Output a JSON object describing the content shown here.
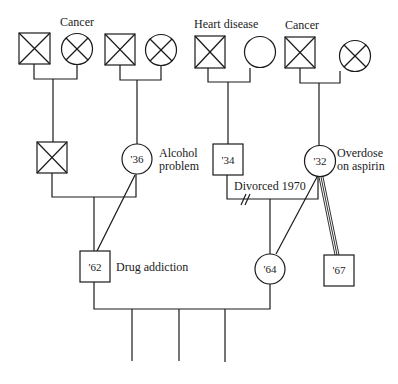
{
  "diagram": {
    "type": "genogram",
    "generation1": {
      "couple1": {
        "label": "Cancer",
        "male": "deceased",
        "female": "deceased"
      },
      "couple2": {
        "male": "deceased",
        "female": "deceased"
      },
      "couple3": {
        "label": "Heart disease",
        "male": "deceased",
        "female": "living"
      },
      "couple4": {
        "label": "Cancer",
        "male": "deceased",
        "female": "deceased"
      }
    },
    "generation2": {
      "person1": {
        "sex": "male",
        "status": "deceased"
      },
      "person2": {
        "sex": "female",
        "year": "'36",
        "note_line1": "Alcohol",
        "note_line2": "problem"
      },
      "person3": {
        "sex": "male",
        "year": "'34"
      },
      "person4": {
        "sex": "female",
        "year": "'32",
        "note_line1": "Overdose",
        "note_line2": "on aspirin"
      },
      "divorce_label": "Divorced 1970"
    },
    "generation3": {
      "person1": {
        "sex": "male",
        "year": "'62",
        "note": "Drug addiction"
      },
      "person2": {
        "sex": "female",
        "year": "'64"
      },
      "person3": {
        "sex": "male",
        "year": "'67"
      }
    },
    "generation4": {
      "children_count": 3
    }
  }
}
